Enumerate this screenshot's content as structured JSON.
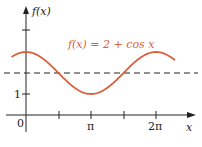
{
  "chart_data": {
    "type": "line",
    "title": "",
    "function_label": "f(x) = 2 + cos x",
    "ylabel": "f(x)",
    "xlabel": "x",
    "x_ticks": [
      "0",
      "π",
      "2π"
    ],
    "y_ticks": [
      "1"
    ],
    "reference_line": {
      "y": 2,
      "style": "dashed"
    },
    "series": [
      {
        "name": "f(x) = 2 + cos x",
        "color": "#d9603b",
        "x_range": [
          -0.7,
          7.2
        ],
        "min": 1,
        "max": 3
      }
    ],
    "grid": false,
    "legend": "none"
  },
  "labels": {
    "ylabel": "f(x)",
    "xlabel": "x",
    "origin": "0",
    "pi": "π",
    "two_pi": "2π",
    "one": "1",
    "function": "f(x) = 2 + cos x"
  }
}
